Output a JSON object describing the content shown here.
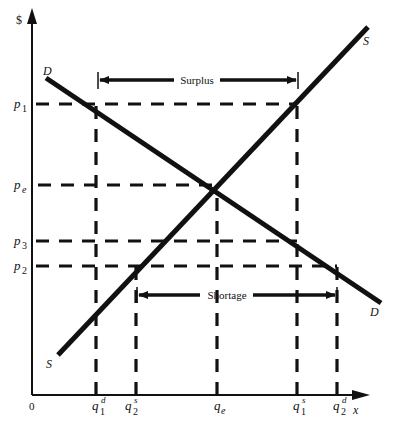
{
  "diagram": {
    "y_axis_label": "$",
    "x_axis_label": "x",
    "origin_label": "0",
    "curves": {
      "demand": {
        "label": "D",
        "end_label": "D"
      },
      "supply": {
        "label": "S",
        "end_label": "S"
      }
    },
    "price_labels": {
      "p1": {
        "base": "p",
        "sub": "1"
      },
      "pe": {
        "base": "p",
        "sub": "e"
      },
      "p3": {
        "base": "p",
        "sub": "3"
      },
      "p2": {
        "base": "p",
        "sub": "2"
      }
    },
    "quantity_labels": {
      "q1d": {
        "base": "q",
        "sup": "d",
        "sub": "1"
      },
      "q2s": {
        "base": "q",
        "sup": "s",
        "sub": "2"
      },
      "qe": {
        "base": "q",
        "sub": "e"
      },
      "q1s": {
        "base": "q",
        "sup": "s",
        "sub": "1"
      },
      "q2d": {
        "base": "q",
        "sup": "d",
        "sub": "2"
      }
    },
    "annotations": {
      "surplus": "Surplus",
      "shortage": "Shortage"
    },
    "colors": {
      "ink": "#111111",
      "background": "#ffffff"
    }
  }
}
